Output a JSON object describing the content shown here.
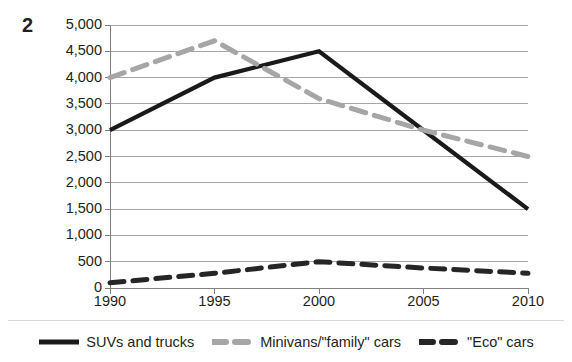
{
  "figure": {
    "number": "2"
  },
  "colors": {
    "suv": "#1a1a1a",
    "minivan": "#a6a6a6",
    "eco": "#262626",
    "gridline": "#a6a6a6",
    "axis": "#808080",
    "text": "#231f20",
    "background": "#ffffff"
  },
  "legend": {
    "position": "bottom",
    "items": [
      {
        "label": "SUVs and trucks",
        "key": "suv",
        "style": "solid",
        "color": "#1a1a1a"
      },
      {
        "label": "Minivans/\"family\" cars",
        "key": "minivan",
        "style": "dashed",
        "color": "#a6a6a6"
      },
      {
        "label": "\"Eco\" cars",
        "key": "eco",
        "style": "dashed",
        "color": "#262626"
      }
    ]
  },
  "chart_data": {
    "type": "line",
    "title": "",
    "subtitle": "",
    "xlabel": "",
    "ylabel": "",
    "x": [
      1990,
      1995,
      2000,
      2005,
      2010
    ],
    "categories": [
      "1990",
      "1995",
      "2000",
      "2005",
      "2010"
    ],
    "xlim": [
      1990,
      2010
    ],
    "ylim": [
      0,
      5000
    ],
    "ytick_values": [
      0,
      500,
      1000,
      1500,
      2000,
      2500,
      3000,
      3500,
      4000,
      4500,
      5000
    ],
    "ytick_labels": [
      "0",
      "500",
      "1,000",
      "1,500",
      "2,000",
      "2,500",
      "3,000",
      "3,500",
      "4,000",
      "4,500",
      "5,000"
    ],
    "xtick_labels": [
      "1990",
      "1995",
      "2000",
      "2005",
      "2010"
    ],
    "grid": true,
    "grid_axis": "y",
    "series": [
      {
        "name": "SUVs and trucks",
        "key": "suv",
        "style": "solid",
        "color": "#1a1a1a",
        "values": [
          3000,
          4000,
          4500,
          3000,
          1500
        ]
      },
      {
        "name": "Minivans/\"family\" cars",
        "key": "minivan",
        "style": "dashed",
        "color": "#a6a6a6",
        "values": [
          4000,
          4700,
          3600,
          3000,
          2500
        ]
      },
      {
        "name": "\"Eco\" cars",
        "key": "eco",
        "style": "dashed",
        "color": "#262626",
        "values": [
          100,
          280,
          500,
          380,
          280
        ]
      }
    ]
  }
}
